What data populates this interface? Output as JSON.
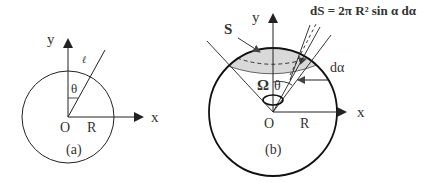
{
  "figure_a": {
    "caption": "(a)",
    "axis_x_label": "x",
    "axis_y_label": "y",
    "origin_label": "O",
    "radius_label": "R",
    "angle_label": "θ",
    "line_label": "ℓ"
  },
  "figure_b": {
    "caption": "(b)",
    "axis_x_label": "x",
    "axis_y_label": "y",
    "origin_label": "O",
    "radius_label": "R",
    "angle_label": "θ",
    "solid_angle_label": "Ω",
    "surface_label": "S",
    "differential_angle_label": "dα",
    "formula": "dS = 2π R² sin α dα"
  },
  "colors": {
    "stroke": "#222222",
    "text": "#333333",
    "shade": "#d9d9d9"
  }
}
